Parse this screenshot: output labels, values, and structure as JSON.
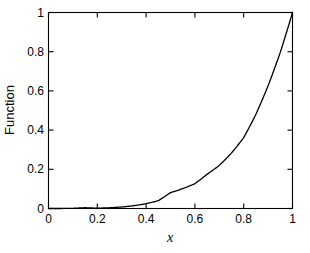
{
  "chart_data": {
    "type": "line",
    "title": "",
    "subtitle": "",
    "xlabel": "x",
    "ylabel": "Function",
    "xlim": [
      0,
      1
    ],
    "ylim": [
      0,
      1
    ],
    "grid": false,
    "legend": null,
    "legend_position": "none",
    "box": true,
    "tick_direction": "in",
    "line_color": "#000000",
    "background_color": "#ffffff",
    "xticks": [
      0,
      0.2,
      0.4,
      0.6,
      0.8,
      1
    ],
    "xticklabels": [
      "0",
      "0.2",
      "0.4",
      "0.6",
      "0.8",
      "1"
    ],
    "yticks": [
      0,
      0.2,
      0.4,
      0.6,
      0.8,
      1
    ],
    "yticklabels": [
      "0",
      "0.2",
      "0.4",
      "0.6",
      "0.8",
      "1"
    ],
    "series": [
      {
        "name": "Function",
        "x": [
          0,
          0.05,
          0.1,
          0.15,
          0.2,
          0.25,
          0.3,
          0.35,
          0.4,
          0.45,
          0.5,
          0.55,
          0.6,
          0.65,
          0.7,
          0.75,
          0.8,
          0.85,
          0.9,
          0.95,
          1
        ],
        "y": [
          0,
          0.0001,
          0.0016,
          0.0078,
          0.0024,
          0.0055,
          0.011,
          0.02,
          0.033,
          0.052,
          0.118,
          0.135,
          0.153,
          0.206,
          0.239,
          0.293,
          0.357,
          0.48,
          0.63,
          0.8,
          1
        ]
      }
    ]
  },
  "labels": {
    "y_axis_title": "Function",
    "x_axis_title": "x",
    "y_tick_0": "0",
    "y_tick_1": "0.2",
    "y_tick_2": "0.4",
    "y_tick_3": "0.6",
    "y_tick_4": "0.8",
    "y_tick_5": "1",
    "x_tick_0": "0",
    "x_tick_1": "0.2",
    "x_tick_2": "0.4",
    "x_tick_3": "0.6",
    "x_tick_4": "0.8",
    "x_tick_5": "1"
  }
}
